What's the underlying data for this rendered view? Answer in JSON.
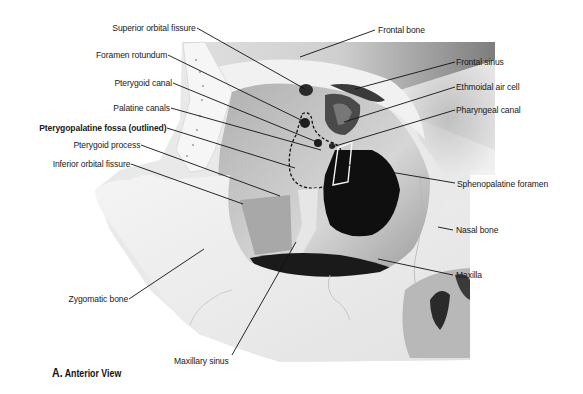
{
  "figure": {
    "caption_letter": "A.",
    "caption_text": "Anterior View",
    "colors": {
      "background": "#ffffff",
      "bone_light": "#f2f2f2",
      "bone_mid": "#c8c8c8",
      "bone_dark": "#8a8a8a",
      "cavity": "#111111",
      "text": "#1a1a1a",
      "leader": "#111111"
    }
  },
  "labels": {
    "left": [
      {
        "id": "superior-orbital-fissure",
        "text": "Superior orbital fissure",
        "bold": false
      },
      {
        "id": "foramen-rotundum",
        "text": "Foramen rotundum",
        "bold": false
      },
      {
        "id": "pterygoid-canal",
        "text": "Pterygoid canal",
        "bold": false
      },
      {
        "id": "palatine-canals",
        "text": "Palatine canals",
        "bold": false
      },
      {
        "id": "pterygopalatine-fossa",
        "text": "Pterygopalatine fossa (outlined)",
        "bold": true
      },
      {
        "id": "pterygoid-process",
        "text": "Pterygoid process",
        "bold": false
      },
      {
        "id": "inferior-orbital-fissure",
        "text": "Inferior orbital fissure",
        "bold": false
      },
      {
        "id": "zygomatic-bone",
        "text": "Zygomatic bone",
        "bold": false
      }
    ],
    "right": [
      {
        "id": "frontal-bone",
        "text": "Frontal bone",
        "bold": false
      },
      {
        "id": "frontal-sinus",
        "text": "Frontal sinus",
        "bold": false
      },
      {
        "id": "ethmoidal-air-cell",
        "text": "Ethmoidal air cell",
        "bold": false
      },
      {
        "id": "pharyngeal-canal",
        "text": "Pharyngeal canal",
        "bold": false
      },
      {
        "id": "sphenopalatine-foramen",
        "text": "Sphenopalatine foramen",
        "bold": false
      },
      {
        "id": "nasal-bone",
        "text": "Nasal bone",
        "bold": false
      },
      {
        "id": "maxilla",
        "text": "Maxilla",
        "bold": false
      }
    ],
    "bottom": [
      {
        "id": "maxillary-sinus",
        "text": "Maxillary sinus",
        "bold": false
      }
    ]
  }
}
